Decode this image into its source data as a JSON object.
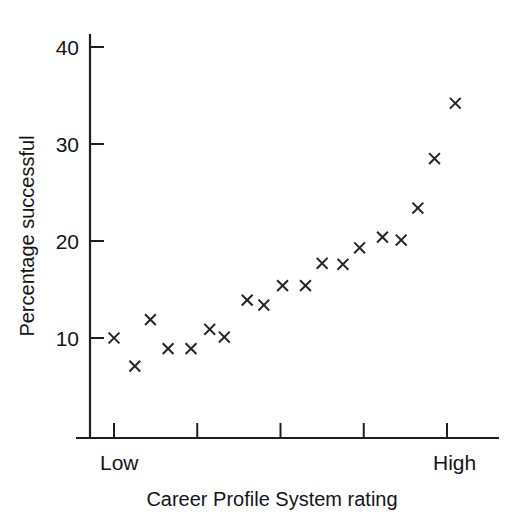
{
  "chart_data": {
    "type": "scatter",
    "title": "",
    "xlabel": "Career Profile System rating",
    "ylabel": "Percentage successful",
    "marker": "x",
    "marker_color": "#24242a",
    "grid": false,
    "legend": null,
    "xlim": [
      0,
      22
    ],
    "ylim": [
      0,
      42
    ],
    "yticks": [
      10,
      20,
      30,
      40
    ],
    "ytick_labels": [
      "10",
      "20",
      "30",
      "40"
    ],
    "xticks": [
      1,
      5,
      9,
      13,
      17
    ],
    "xtick_labels": [
      "",
      "",
      "",
      "",
      ""
    ],
    "x_category_labels": [
      {
        "value": 1,
        "label": "Low"
      },
      {
        "value": 17,
        "label": "High"
      }
    ],
    "points": [
      {
        "x": 1.0,
        "y": 10.0
      },
      {
        "x": 2.0,
        "y": 7.1
      },
      {
        "x": 2.75,
        "y": 11.9
      },
      {
        "x": 3.6,
        "y": 8.9
      },
      {
        "x": 4.7,
        "y": 8.9
      },
      {
        "x": 5.6,
        "y": 10.9
      },
      {
        "x": 6.3,
        "y": 10.1
      },
      {
        "x": 7.4,
        "y": 13.9
      },
      {
        "x": 8.2,
        "y": 13.4
      },
      {
        "x": 9.1,
        "y": 15.4
      },
      {
        "x": 10.2,
        "y": 15.4
      },
      {
        "x": 11.0,
        "y": 17.7
      },
      {
        "x": 12.0,
        "y": 17.6
      },
      {
        "x": 12.8,
        "y": 19.3
      },
      {
        "x": 13.9,
        "y": 20.4
      },
      {
        "x": 14.8,
        "y": 20.1
      },
      {
        "x": 15.6,
        "y": 23.4
      },
      {
        "x": 16.4,
        "y": 28.5
      },
      {
        "x": 17.4,
        "y": 34.2
      }
    ]
  }
}
